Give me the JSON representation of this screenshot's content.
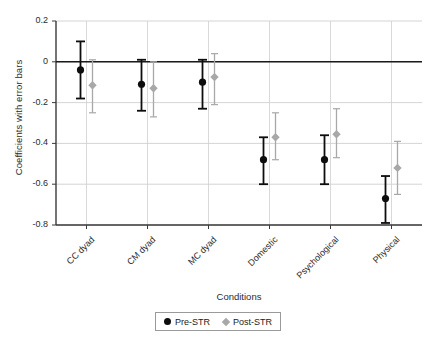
{
  "chart_data": {
    "type": "scatter",
    "title": "",
    "xlabel": "Conditions",
    "ylabel": "Coefficients with error bars",
    "categories": [
      "CC dyad",
      "CM dyad",
      "MC dyad",
      "Domestic",
      "Psychological",
      "Physical"
    ],
    "ylim": [
      -0.8,
      0.2
    ],
    "yticks": [
      0.2,
      0,
      -0.2,
      -0.4,
      -0.6,
      -0.8
    ],
    "ytick_labels": [
      "0.2",
      "0",
      "-0.2",
      "-0.4",
      "-0.6",
      "-0.8"
    ],
    "grid": true,
    "legend_position": "bottom",
    "reference_line": 0,
    "series": [
      {
        "name": "Pre-STR",
        "marker": "circle",
        "color": "#0d0d0d",
        "values": [
          -0.04,
          -0.11,
          -0.1,
          -0.48,
          -0.48,
          -0.67
        ],
        "ci_upper": [
          0.1,
          0.01,
          0.01,
          -0.37,
          -0.36,
          -0.56
        ],
        "ci_lower": [
          -0.18,
          -0.24,
          -0.23,
          -0.6,
          -0.6,
          -0.79
        ]
      },
      {
        "name": "Post-STR",
        "marker": "diamond",
        "color": "#a8a8a8",
        "values": [
          -0.115,
          -0.13,
          -0.075,
          -0.37,
          -0.355,
          -0.52
        ],
        "ci_upper": [
          0.01,
          0.0,
          0.04,
          -0.25,
          -0.23,
          -0.39
        ],
        "ci_lower": [
          -0.25,
          -0.27,
          -0.21,
          -0.48,
          -0.47,
          -0.65
        ]
      }
    ]
  },
  "legend": {
    "items": [
      {
        "label": "Pre-STR"
      },
      {
        "label": "Post-STR"
      }
    ]
  }
}
